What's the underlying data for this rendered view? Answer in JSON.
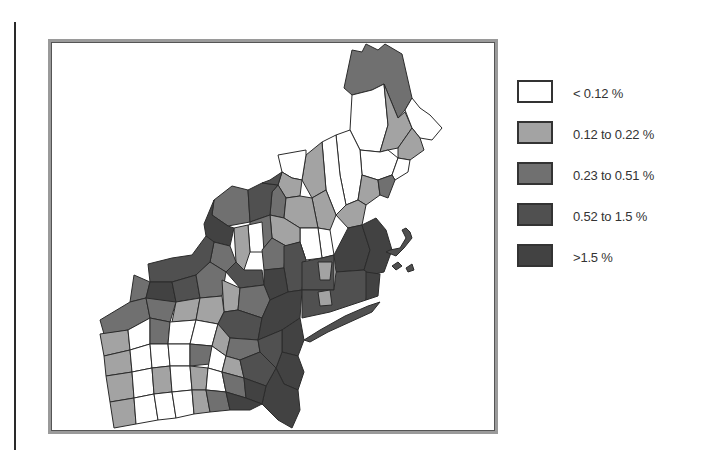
{
  "map": {
    "region": "Northeastern United States (counties)",
    "colors": {
      "outline": "#2b2b2b",
      "frame": "#9a9a9a",
      "background": "#ffffff"
    }
  },
  "legend": {
    "items": [
      {
        "label": "< 0.12 %",
        "color": "#ffffff"
      },
      {
        "label": "0.12 to 0.22 %",
        "color": "#a3a3a3"
      },
      {
        "label": "0.23 to 0.51 %",
        "color": "#707070"
      },
      {
        "label": "0.52 to 1.5 %",
        "color": "#505050"
      },
      {
        "label": ">1.5 %",
        "color": "#424242"
      }
    ]
  }
}
